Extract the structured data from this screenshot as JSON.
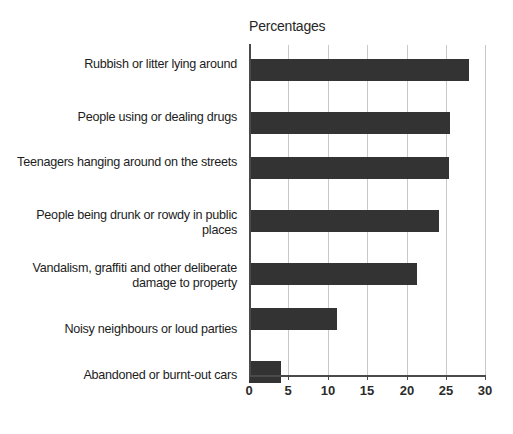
{
  "chart_data": {
    "type": "bar",
    "orientation": "horizontal",
    "title": "",
    "axis_title": "Percentages",
    "xlabel": "",
    "ylabel": "",
    "xlim": [
      0,
      30
    ],
    "xticks": [
      0,
      5,
      10,
      15,
      20,
      25,
      30
    ],
    "xtick_labels": [
      "0",
      "5",
      "10",
      "15",
      "20",
      "25",
      "30"
    ],
    "grid": true,
    "grid_axis": "x",
    "legend": false,
    "bar_color": "#333333",
    "categories": [
      "Rubbish or litter lying around",
      "People using or dealing drugs",
      "Teenagers hanging around on the streets",
      "People being drunk or rowdy in public places",
      "Vandalism, graffiti and other deliberate damage to property",
      "Noisy neighbours or loud parties",
      "Abandoned or burnt-out cars"
    ],
    "values": [
      28.0,
      25.6,
      25.4,
      24.1,
      21.3,
      11.2,
      4.1
    ]
  }
}
